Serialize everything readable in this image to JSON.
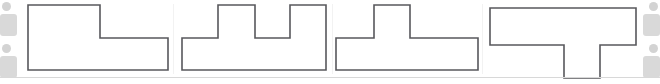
{
  "canvas": {
    "width": 660,
    "height": 84,
    "background": "#ffffff",
    "stroke_color": "#58585c",
    "fill_color": "#ffffff",
    "rule_color": "#d8d8d8",
    "divider_color": "#f2f2f2"
  },
  "rails": {
    "placeholder_color": "#d9d9d9",
    "dot_color": "#d3d3d3",
    "left": {
      "dot_top_name": "left-rail-dot-top",
      "block_top_name": "left-rail-block-top",
      "dot_bottom_name": "left-rail-dot-bottom",
      "block_bottom_name": "left-rail-block-bottom"
    },
    "right": {
      "dot_top_name": "right-rail-dot-top",
      "block_top_name": "right-rail-block-top",
      "dot_bottom_name": "right-rail-dot-bottom",
      "block_bottom_name": "right-rail-block-bottom"
    }
  },
  "rules": {
    "bottom_rule_y": 77,
    "divider_x": [
      173,
      332,
      482
    ]
  },
  "shapes": [
    {
      "id": "shape-1",
      "name": "L-shaped-step-polygon",
      "description": "Rectangle with a raised block on the left half; step down to a lower right half",
      "x": 24,
      "y": 0,
      "width": 146,
      "height": 80,
      "points": "4,5 76,5 76,38 144,38 144,70 4,70"
    },
    {
      "id": "shape-2",
      "name": "double-tower-crenellated-polygon",
      "description": "Wide base bar with two tall rectangular towers separated by a notch",
      "x": 178,
      "y": 0,
      "width": 154,
      "height": 80,
      "points": "4,38 40,38 40,5 77,5 77,38 112,38 112,5 148,5 148,70 4,70"
    },
    {
      "id": "shape-3",
      "name": "t-shaped-upward-tab-polygon",
      "description": "Wide base bar with a single tall tower rising from the left-center",
      "x": 334,
      "y": 0,
      "width": 146,
      "height": 80,
      "points": "2,38 40,38 40,5 76,5 76,38 144,38 144,70 2,70"
    },
    {
      "id": "shape-4",
      "name": "inverted-t-downward-tab-polygon",
      "description": "Wide top bar with a rectangular tab descending from the right-center",
      "x": 486,
      "y": 0,
      "width": 152,
      "height": 80,
      "points": "4,8 150,8 150,45 114,45 114,78 78,78 78,45 4,45"
    }
  ]
}
